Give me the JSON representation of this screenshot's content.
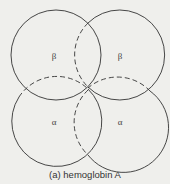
{
  "diagram": {
    "caption": "(a)  hemoglobin A",
    "subunits": [
      {
        "id": "beta-top-left",
        "label": "β",
        "cx": 56,
        "cy": 55,
        "r": 45
      },
      {
        "id": "beta-top-right",
        "label": "β",
        "cx": 118,
        "cy": 55,
        "r": 45
      },
      {
        "id": "alpha-bottom-left",
        "label": "α",
        "cx": 58,
        "cy": 123,
        "r": 45
      },
      {
        "id": "alpha-bottom-right",
        "label": "α",
        "cx": 118,
        "cy": 122,
        "r": 45
      }
    ],
    "line_color": "#333333",
    "background": "#efefec"
  }
}
